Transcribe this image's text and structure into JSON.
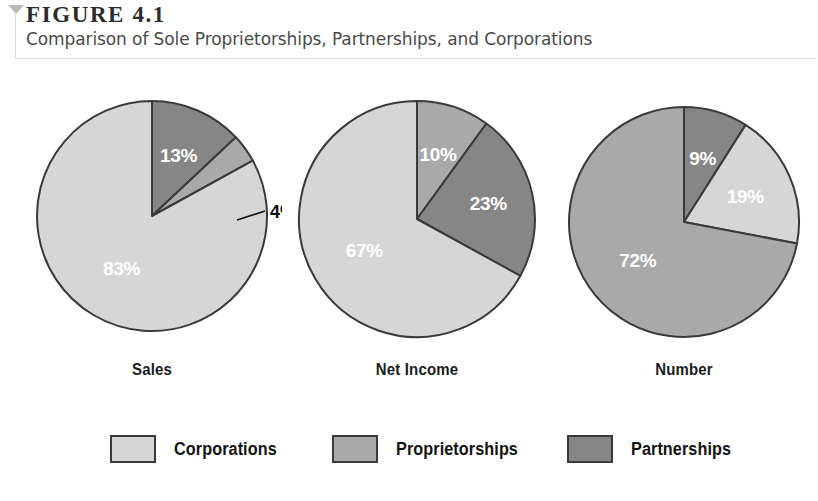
{
  "header": {
    "marker_icon": "triangle-down-icon",
    "figure_number": "FIGURE 4.1",
    "caption": "Comparison of Sole Proprietorships, Partnerships, and Corporations"
  },
  "colors": {
    "corporations": "#d6d6d6",
    "proprietorships": "#a9a9a9",
    "partnerships": "#868686",
    "outline": "#3a3a3a",
    "label_text": "#ffffff",
    "callout_text": "#0d0d0d"
  },
  "legend": {
    "items": [
      {
        "label": "Corporations",
        "color": "#d6d6d6",
        "left": 110
      },
      {
        "label": "Proprietorships",
        "color": "#a9a9a9",
        "left": 332
      },
      {
        "label": "Partnerships",
        "color": "#868686",
        "left": 567
      }
    ]
  },
  "chart_data": {
    "type": "pie",
    "title": "Comparison of Sole Proprietorships, Partnerships, and Corporations",
    "subtitle": "FIGURE 4.1",
    "legend_position": "bottom",
    "legend_entries": [
      "Corporations",
      "Proprietorships",
      "Partnerships"
    ],
    "units": "percent",
    "charts": [
      {
        "name": "Sales",
        "label": "Sales",
        "slices": [
          {
            "category": "Partnerships",
            "value": 13,
            "display": "13%",
            "color": "#868686",
            "label_placement": "inside"
          },
          {
            "category": "Proprietorships",
            "value": 4,
            "display": "4%",
            "color": "#a9a9a9",
            "label_placement": "callout"
          },
          {
            "category": "Corporations",
            "value": 83,
            "display": "83%",
            "color": "#d6d6d6",
            "label_placement": "inside"
          }
        ]
      },
      {
        "name": "Net Income",
        "label": "Net Income",
        "slices": [
          {
            "category": "Proprietorships",
            "value": 10,
            "display": "10%",
            "color": "#a9a9a9",
            "label_placement": "inside"
          },
          {
            "category": "Partnerships",
            "value": 23,
            "display": "23%",
            "color": "#868686",
            "label_placement": "inside"
          },
          {
            "category": "Corporations",
            "value": 67,
            "display": "67%",
            "color": "#d6d6d6",
            "label_placement": "inside"
          }
        ]
      },
      {
        "name": "Number",
        "label": "Number",
        "slices": [
          {
            "category": "Partnerships",
            "value": 9,
            "display": "9%",
            "color": "#868686",
            "label_placement": "inside"
          },
          {
            "category": "Corporations",
            "value": 19,
            "display": "19%",
            "color": "#d6d6d6",
            "label_placement": "inside"
          },
          {
            "category": "Proprietorships",
            "value": 72,
            "display": "72%",
            "color": "#a9a9a9",
            "label_placement": "inside"
          }
        ]
      }
    ]
  },
  "pie_geometry": [
    {
      "group_left": 22,
      "cx": 130,
      "cy": 148,
      "r": 115
    },
    {
      "group_left": 287,
      "cx": 130,
      "cy": 151,
      "r": 118
    },
    {
      "group_left": 554,
      "cx": 130,
      "cy": 154,
      "r": 115
    }
  ],
  "callout": {
    "line_x1": 243,
    "line_y1": 143,
    "line_x2": 215,
    "line_y2": 152,
    "text_x": 248,
    "text_y": 150
  }
}
